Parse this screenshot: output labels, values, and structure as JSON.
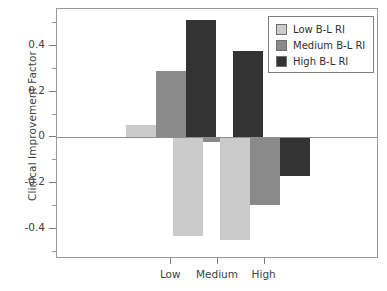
{
  "chart_data": {
    "type": "bar",
    "title": "",
    "xlabel": "",
    "ylabel": "Clinical Improvement Factor",
    "categories": [
      "Low",
      "Medium",
      "High"
    ],
    "series": [
      {
        "name": "Low B-L RI",
        "color": "#cbcbcb",
        "values": [
          0.055,
          -0.43,
          -0.445
        ]
      },
      {
        "name": "Medium B-L RI",
        "color": "#8a8a8a",
        "values": [
          0.29,
          -0.02,
          -0.295
        ]
      },
      {
        "name": "High B-L RI",
        "color": "#333333",
        "values": [
          0.51,
          0.375,
          -0.17
        ]
      }
    ],
    "ylim": [
      -0.53,
      0.56
    ],
    "y_major_ticks": [
      0.4,
      0.2,
      0,
      -0.2,
      -0.4
    ],
    "y_major_tick_labels": [
      "0.4",
      "0.2",
      "0",
      "-0.2",
      "-0.4"
    ],
    "y_minor_ticks": [
      0.5,
      0.3,
      0.1,
      -0.1,
      -0.3,
      -0.5
    ],
    "grid": false,
    "legend_position": "top-right",
    "zero_line": true
  },
  "axes": {
    "y_title": "Clinical Improvement Factor"
  },
  "legend": {
    "entries": [
      {
        "label": "Low B-L RI"
      },
      {
        "label": "Medium B-L RI"
      },
      {
        "label": "High B-L RI"
      }
    ]
  }
}
